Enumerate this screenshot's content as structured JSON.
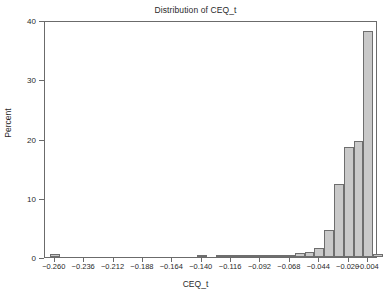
{
  "chart_data": {
    "type": "bar",
    "title": "Distribution of CEQ_t",
    "xlabel": "CEQ_t",
    "ylabel": "Percent",
    "grid": false,
    "legend": null,
    "ylim": [
      0,
      40
    ],
    "yticks": [
      0,
      10,
      20,
      30,
      40
    ],
    "ytick_labels": [
      "0",
      "10",
      "20",
      "30",
      "40"
    ],
    "xlim": [
      -0.268,
      0.004
    ],
    "xticks": [
      -0.26,
      -0.236,
      -0.212,
      -0.188,
      -0.164,
      -0.14,
      -0.116,
      -0.092,
      -0.068,
      -0.044,
      -0.02,
      -0.004
    ],
    "xtick_labels": [
      "-0.260",
      "-0.236",
      "-0.212",
      "-0.188",
      "-0.164",
      "-0.140",
      "-0.116",
      "-0.092",
      "-0.068",
      "-0.044",
      "-0.020",
      "-0.004"
    ],
    "bin_width": 0.008,
    "bar_color": "#c9c9c9",
    "bar_edge_color": "#6e6e6e",
    "categories": [
      "-0.260",
      "-0.252",
      "-0.244",
      "-0.236",
      "-0.228",
      "-0.220",
      "-0.212",
      "-0.204",
      "-0.196",
      "-0.188",
      "-0.180",
      "-0.172",
      "-0.164",
      "-0.156",
      "-0.148",
      "-0.140",
      "-0.132",
      "-0.124",
      "-0.116",
      "-0.108",
      "-0.100",
      "-0.092",
      "-0.084",
      "-0.076",
      "-0.068",
      "-0.060",
      "-0.052",
      "-0.044",
      "-0.036",
      "-0.028",
      "-0.020",
      "-0.012",
      "-0.004",
      "0.004"
    ],
    "bin_centers": [
      -0.26,
      -0.252,
      -0.244,
      -0.236,
      -0.228,
      -0.22,
      -0.212,
      -0.204,
      -0.196,
      -0.188,
      -0.18,
      -0.172,
      -0.164,
      -0.156,
      -0.148,
      -0.14,
      -0.132,
      -0.124,
      -0.116,
      -0.108,
      -0.1,
      -0.092,
      -0.084,
      -0.076,
      -0.068,
      -0.06,
      -0.052,
      -0.044,
      -0.036,
      -0.028,
      -0.02,
      -0.012,
      -0.004,
      0.004
    ],
    "values": [
      0.5,
      0,
      0,
      0,
      0,
      0,
      0,
      0,
      0,
      0,
      0,
      0,
      0,
      0,
      0,
      0.3,
      0,
      0.3,
      0.2,
      0.2,
      0.2,
      0.3,
      0.3,
      0.3,
      0.4,
      0.6,
      0.9,
      1.5,
      4.5,
      12.3,
      18.6,
      19.6,
      38.1,
      0.5
    ],
    "extra_bar": {
      "center": 0.004,
      "value": 1.8,
      "note": "rightmost bar beyond -0.004 tick"
    }
  }
}
